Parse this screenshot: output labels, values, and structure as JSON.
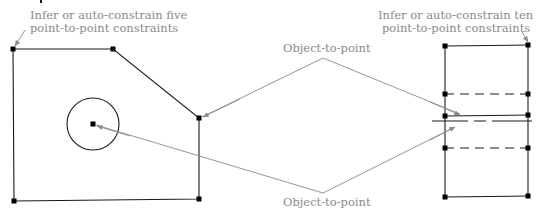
{
  "labels": {
    "left_note_line1": "Infer or auto-constrain five",
    "left_note_line2": "point-to-point constraints",
    "right_note_line1": "Infer or auto-constrain ten",
    "right_note_line2": "point-to-point constraints",
    "upper_callout": "Object-to-point",
    "lower_callout": "Object-to-point"
  },
  "colors": {
    "geometry": "#1a1a1a",
    "annotation": "#8a8a8a",
    "point": "#000000"
  }
}
